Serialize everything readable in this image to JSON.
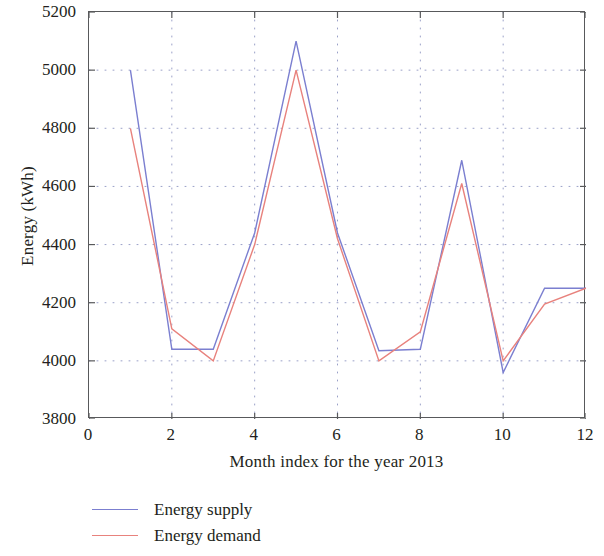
{
  "chart_data": {
    "type": "line",
    "title": "",
    "xlabel": "Month index for the year 2013",
    "ylabel": "Energy (kWh)",
    "x": [
      1,
      2,
      3,
      4,
      5,
      6,
      7,
      8,
      9,
      10,
      11,
      12
    ],
    "xlim": [
      0,
      12
    ],
    "ylim": [
      3800,
      5200
    ],
    "xticks": [
      "0",
      "2",
      "4",
      "6",
      "8",
      "10",
      "12"
    ],
    "xtick_values": [
      0,
      2,
      4,
      6,
      8,
      10,
      12
    ],
    "yticks": [
      "3800",
      "4000",
      "4200",
      "4400",
      "4600",
      "4800",
      "5000",
      "5200"
    ],
    "ytick_values": [
      3800,
      4000,
      4200,
      4400,
      4600,
      4800,
      5000,
      5200
    ],
    "grid": true,
    "grid_style": "dotted",
    "legend_position": "below-left",
    "series": [
      {
        "name": "Energy supply",
        "color": "#7b7fd0",
        "values": [
          5000,
          4040,
          4040,
          4440,
          5100,
          4440,
          4035,
          4040,
          4690,
          3960,
          4250,
          4250
        ]
      },
      {
        "name": "Energy demand",
        "color": "#e8827d",
        "values": [
          4800,
          4110,
          4000,
          4400,
          5000,
          4420,
          4000,
          4100,
          4610,
          4000,
          4195,
          4250
        ]
      }
    ]
  },
  "axes": {
    "frame_color": "#58595b",
    "grid_color": "#9aa0c8",
    "text_color": "#231f20"
  }
}
